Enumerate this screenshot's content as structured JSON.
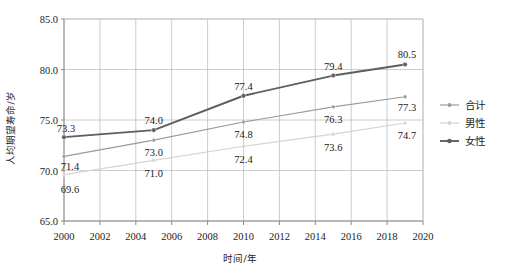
{
  "chart_data": {
    "type": "line",
    "title": "",
    "xlabel": "时间/年",
    "ylabel": "人均期望寿命/岁",
    "x": [
      2000,
      2005,
      2010,
      2015,
      2019
    ],
    "xlim": [
      2000,
      2020
    ],
    "ylim": [
      65.0,
      85.0
    ],
    "xticks": [
      "2000",
      "2002",
      "2004",
      "2006",
      "2008",
      "2010",
      "2012",
      "2014",
      "2016",
      "2018",
      "2020"
    ],
    "xtick_values": [
      2000,
      2002,
      2004,
      2006,
      2008,
      2010,
      2012,
      2014,
      2016,
      2018,
      2020
    ],
    "yticks": [
      "65.0",
      "70.0",
      "75.0",
      "80.0",
      "85.0"
    ],
    "ytick_values": [
      65.0,
      70.0,
      75.0,
      80.0,
      85.0
    ],
    "grid": true,
    "legend_position": "right",
    "series": [
      {
        "name": "合计",
        "color": "#9a9a9a",
        "values": [
          71.4,
          73.0,
          74.8,
          76.3,
          77.3
        ],
        "labels": [
          "71.4",
          "73.0",
          "74.8",
          "76.3",
          "77.3"
        ]
      },
      {
        "name": "男性",
        "color": "#d4d4d4",
        "values": [
          69.6,
          71.0,
          72.4,
          73.6,
          74.7
        ],
        "labels": [
          "69.6",
          "71.0",
          "72.4",
          "73.6",
          "74.7"
        ]
      },
      {
        "name": "女性",
        "color": "#5e5e5e",
        "values": [
          73.3,
          74.0,
          77.4,
          79.4,
          80.5
        ],
        "labels": [
          "73.3",
          "74.0",
          "77.4",
          "79.4",
          "80.5"
        ]
      }
    ]
  },
  "legend": {
    "items": [
      {
        "label": "合计"
      },
      {
        "label": "男性"
      },
      {
        "label": "女性"
      }
    ]
  }
}
